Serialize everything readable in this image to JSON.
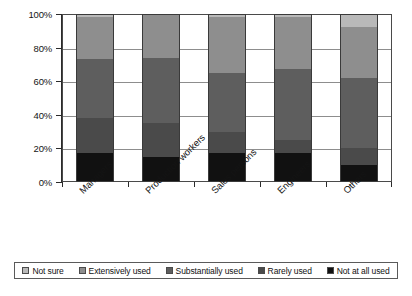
{
  "chart_data": {
    "type": "bar",
    "title": "",
    "subtitle": "",
    "xlabel": "",
    "ylabel": "",
    "stacked": true,
    "stack_total": 100,
    "grid": true,
    "legend_position": "bottom",
    "ylim": [
      0,
      100
    ],
    "ytick_labels": [
      "0%",
      "20%",
      "40%",
      "60%",
      "80%",
      "100%"
    ],
    "ytick_values": [
      0,
      20,
      40,
      60,
      80,
      100
    ],
    "categories": [
      "Managers",
      "Production workers",
      "Sales persons",
      "Engineers",
      "Others"
    ],
    "series": [
      {
        "name": "Not at all used",
        "color": "#111111",
        "values": [
          17,
          15,
          17,
          17,
          10
        ]
      },
      {
        "name": "Rarely used",
        "color": "#4a4a4a",
        "values": [
          21,
          20,
          13,
          8,
          10
        ]
      },
      {
        "name": "Substantially used",
        "color": "#5e5e5e",
        "values": [
          35,
          39,
          35,
          42,
          42
        ]
      },
      {
        "name": "Extensively used",
        "color": "#8e8e8e",
        "values": [
          25,
          26,
          33,
          31,
          30
        ]
      },
      {
        "name": "Not sure",
        "color": "#b9b9b9",
        "values": [
          2,
          0,
          2,
          2,
          8
        ]
      }
    ]
  },
  "legend": {
    "items": [
      {
        "label": "Not sure",
        "color": "#b9b9b9"
      },
      {
        "label": "Extensively used",
        "color": "#8e8e8e"
      },
      {
        "label": "Substantially used",
        "color": "#5e5e5e"
      },
      {
        "label": "Rarely used",
        "color": "#4a4a4a"
      },
      {
        "label": "Not at all used",
        "color": "#111111"
      }
    ]
  }
}
